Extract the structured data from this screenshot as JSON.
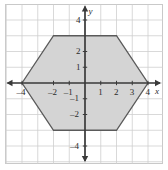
{
  "figure": {
    "title": "",
    "background": "#ffffff",
    "frame_color": "#c9c9c9",
    "grid_color": "#cfcfcf",
    "axis_color": "#3a3a3a",
    "shape_fill": "#d4d4d4",
    "shape_stroke": "#5a5a5a"
  },
  "chart_data": {
    "type": "scatter",
    "title": "",
    "xlabel": "x",
    "ylabel": "y",
    "xlim": [
      -5,
      5
    ],
    "ylim": [
      -5,
      5
    ],
    "grid": true,
    "grid_step": 1,
    "legend": "none",
    "x_ticks": [
      -4,
      -2,
      -1,
      1,
      2,
      3,
      4
    ],
    "x_tick_labels": [
      "–4",
      "–2",
      "–1",
      "1",
      "2",
      "3",
      "4"
    ],
    "y_ticks": [
      4,
      2,
      1,
      -1,
      -2,
      -4
    ],
    "y_tick_labels": [
      "4",
      "2",
      "1",
      "–1",
      "–2",
      "–4"
    ],
    "series": [
      {
        "name": "hexagon",
        "kind": "polygon",
        "closed": true,
        "fill": "#d4d4d4",
        "stroke": "#5a5a5a",
        "points": [
          [
            -4,
            0
          ],
          [
            -2,
            3
          ],
          [
            2,
            3
          ],
          [
            4,
            0
          ],
          [
            2,
            -3
          ],
          [
            -2,
            -3
          ]
        ],
        "vertex_labels": [
          "(–4, 0)",
          "(–2, 3)",
          "(2, 3)",
          "(4, 0)",
          "(2, –3)",
          "(–2, –3)"
        ]
      }
    ],
    "axis_arrows": {
      "x_left": true,
      "x_right": true,
      "y_top": true,
      "y_bottom": true
    }
  }
}
